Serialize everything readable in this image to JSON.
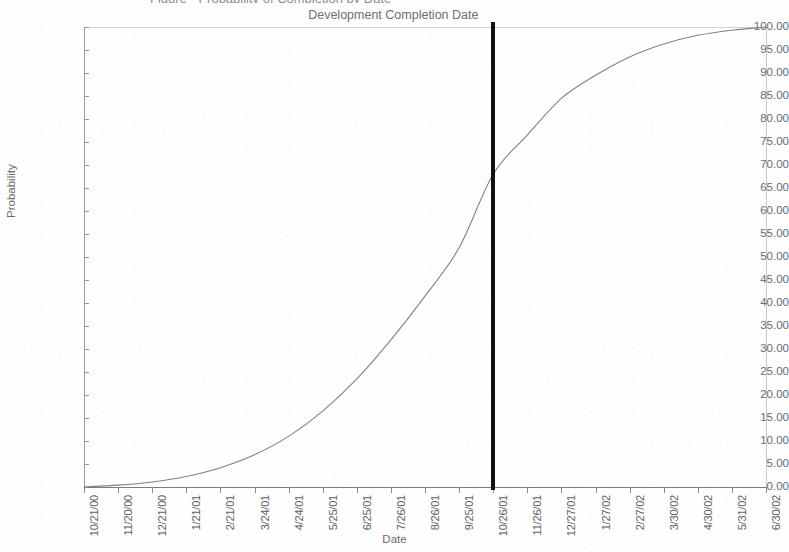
{
  "page": {
    "truncated_title_fragment": "Figure - Probability of Completion by Date"
  },
  "chart": {
    "y_axis_title": "Probability",
    "x_axis_title": "Date",
    "annotation_label": "Development Completion Date"
  },
  "chart_data": {
    "type": "line",
    "title": "",
    "xlabel": "Date",
    "ylabel": "Probability",
    "ylim": [
      0,
      100
    ],
    "ytick_labels": [
      "0.00",
      "5.00",
      "10.00",
      "15.00",
      "20.00",
      "25.00",
      "30.00",
      "35.00",
      "40.00",
      "45.00",
      "50.00",
      "55.00",
      "60.00",
      "65.00",
      "70.00",
      "75.00",
      "80.00",
      "85.00",
      "90.00",
      "95.00",
      "100.00"
    ],
    "ytick_values": [
      0,
      5,
      10,
      15,
      20,
      25,
      30,
      35,
      40,
      45,
      50,
      55,
      60,
      65,
      70,
      75,
      80,
      85,
      90,
      95,
      100
    ],
    "categories": [
      "10/21/00",
      "11/20/00",
      "12/21/00",
      "1/21/01",
      "2/21/01",
      "3/24/01",
      "4/24/01",
      "5/25/01",
      "6/25/01",
      "7/26/01",
      "8/26/01",
      "9/25/01",
      "10/26/01",
      "11/26/01",
      "12/27/01",
      "1/27/02",
      "2/27/02",
      "3/30/02",
      "4/30/02",
      "5/31/02",
      "6/30/02"
    ],
    "series": [
      {
        "name": "Cumulative Probability",
        "values": [
          0.0,
          0.4,
          1.1,
          2.3,
          4.2,
          7.0,
          11.0,
          16.5,
          23.5,
          32.0,
          41.5,
          52.0,
          68.0,
          76.5,
          84.5,
          89.5,
          93.5,
          96.3,
          98.2,
          99.3,
          100.0
        ],
        "color": "#808080"
      }
    ],
    "grid": false,
    "legend": "none",
    "annotations": [
      {
        "label": "Development Completion Date",
        "type": "vertical-line",
        "x_category": "10/26/01",
        "probability_at_line": 68.0,
        "color": "#111111"
      }
    ]
  },
  "colors": {
    "curve": "#808080",
    "marker": "#111111",
    "axis": "#8a8a8a",
    "text": "#6b6b6b",
    "background": "#ffffff"
  }
}
